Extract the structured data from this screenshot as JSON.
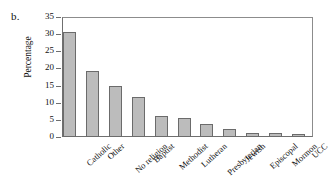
{
  "panel": {
    "letter": "b."
  },
  "chart_data": {
    "type": "bar",
    "title": "",
    "xlabel": "",
    "ylabel": "Percentage",
    "ylim": [
      0,
      35
    ],
    "ytick_labels": [
      "0",
      "5",
      "10",
      "15",
      "20",
      "25",
      "30",
      "35"
    ],
    "ytick_values": [
      0,
      5,
      10,
      15,
      20,
      25,
      30,
      35
    ],
    "grid": false,
    "legend": false,
    "bar_color": "#bcbcbc",
    "bar_edge_color": "#6b6b6b",
    "categories": [
      "Catholic",
      "Other",
      "No religion",
      "Baptist",
      "Methodist",
      "Lutheran",
      "Presbyterian",
      "Jewish",
      "Episcopal",
      "Mormon",
      "UCC"
    ],
    "values": [
      30.6,
      19.2,
      14.9,
      11.6,
      6.1,
      5.5,
      3.8,
      2.4,
      1.3,
      1.1,
      1.0
    ]
  }
}
